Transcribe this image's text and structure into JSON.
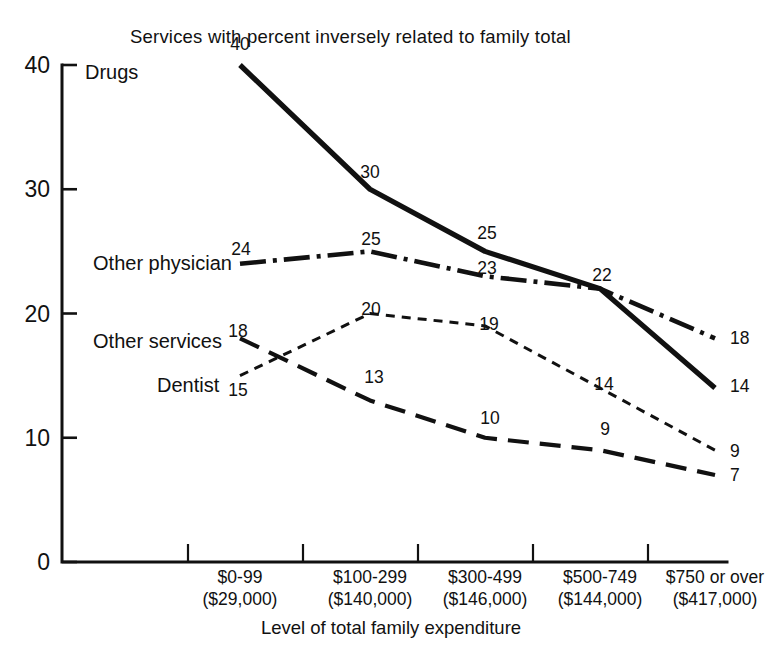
{
  "chart_data": {
    "type": "line",
    "title": "Services with percent inversely related to family total",
    "xlabel": "Level of total family expenditure",
    "ylabel": "",
    "ylim": [
      0,
      40
    ],
    "yticks": [
      0,
      10,
      20,
      30,
      40
    ],
    "grid": false,
    "legend": "inline-left-labels",
    "categories": [
      "$0-99",
      "$100-299",
      "$300-499",
      "$500-749",
      "$750 or over"
    ],
    "category_sublabels": [
      "($29,000)",
      "($140,000)",
      "($146,000)",
      "($144,000)",
      "($417,000)"
    ],
    "series": [
      {
        "name": "Drugs",
        "style": "solid",
        "values": [
          40,
          30,
          25,
          22,
          14
        ]
      },
      {
        "name": "Other physician",
        "style": "dash-dot",
        "values": [
          24,
          25,
          23,
          22,
          18
        ]
      },
      {
        "name": "Other services",
        "style": "short-dash",
        "values": [
          15,
          20,
          19,
          14,
          9
        ]
      },
      {
        "name": "Dentist",
        "style": "long-dash",
        "values": [
          18,
          13,
          10,
          9,
          7
        ]
      }
    ]
  },
  "series_label_positions": [
    {
      "name": "Drugs",
      "x": 85,
      "y": 79,
      "anchor": "start"
    },
    {
      "name": "Other physician",
      "x": 232,
      "y": 270,
      "anchor": "end"
    },
    {
      "name": "Other services",
      "x": 222,
      "y": 348,
      "anchor": "end"
    },
    {
      "name": "Dentist",
      "x": 157,
      "y": 392,
      "anchor": "start"
    }
  ],
  "point_labels": [
    {
      "text": "40",
      "x": 240,
      "y": 50,
      "anchor": "middle"
    },
    {
      "text": "30",
      "x": 370,
      "y": 178,
      "anchor": "middle"
    },
    {
      "text": "25",
      "x": 487,
      "y": 239,
      "anchor": "middle"
    },
    {
      "text": "22",
      "x": 602,
      "y": 281,
      "anchor": "middle"
    },
    {
      "text": "14",
      "x": 730,
      "y": 392,
      "anchor": "start"
    },
    {
      "text": "24",
      "x": 241,
      "y": 255,
      "anchor": "middle"
    },
    {
      "text": "25",
      "x": 371,
      "y": 245,
      "anchor": "middle"
    },
    {
      "text": "23",
      "x": 487,
      "y": 274,
      "anchor": "middle"
    },
    {
      "text": "18",
      "x": 730,
      "y": 344,
      "anchor": "start"
    },
    {
      "text": "15",
      "x": 238,
      "y": 396,
      "anchor": "middle"
    },
    {
      "text": "20",
      "x": 371,
      "y": 315,
      "anchor": "middle"
    },
    {
      "text": "19",
      "x": 489,
      "y": 330,
      "anchor": "middle"
    },
    {
      "text": "14",
      "x": 604,
      "y": 390,
      "anchor": "middle"
    },
    {
      "text": "9",
      "x": 730,
      "y": 457,
      "anchor": "start"
    },
    {
      "text": "18",
      "x": 238,
      "y": 337,
      "anchor": "middle"
    },
    {
      "text": "13",
      "x": 374,
      "y": 383,
      "anchor": "middle"
    },
    {
      "text": "10",
      "x": 490,
      "y": 424,
      "anchor": "middle"
    },
    {
      "text": "9",
      "x": 605,
      "y": 435,
      "anchor": "middle"
    },
    {
      "text": "7",
      "x": 730,
      "y": 481,
      "anchor": "start"
    }
  ]
}
